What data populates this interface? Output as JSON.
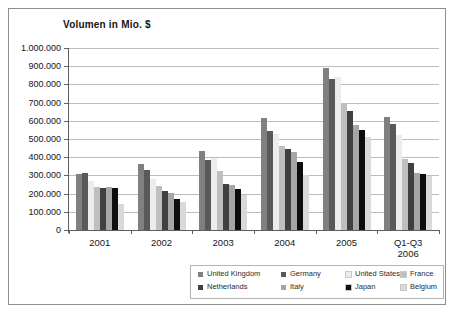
{
  "chart_data": {
    "type": "bar",
    "title": "Volumen in Mio. $",
    "categories": [
      "2001",
      "2002",
      "2003",
      "2004",
      "2005",
      "Q1-Q3 2006"
    ],
    "category_label_lines": [
      [
        "2001"
      ],
      [
        "2002"
      ],
      [
        "2003"
      ],
      [
        "2004"
      ],
      [
        "2005"
      ],
      [
        "Q1-Q3",
        "2006"
      ]
    ],
    "series": [
      {
        "name": "United Kingdom",
        "color": "#808080",
        "values": [
          310000,
          360000,
          435000,
          615000,
          890000,
          620000
        ]
      },
      {
        "name": "Germany",
        "color": "#595959",
        "values": [
          315000,
          330000,
          385000,
          545000,
          830000,
          580000
        ]
      },
      {
        "name": "United States",
        "color": "#ececec",
        "values": [
          270000,
          280000,
          395000,
          530000,
          840000,
          520000
        ]
      },
      {
        "name": "France",
        "color": "#bfbfbf",
        "values": [
          235000,
          240000,
          325000,
          460000,
          700000,
          390000
        ]
      },
      {
        "name": "Netherlands",
        "color": "#404040",
        "values": [
          230000,
          215000,
          255000,
          445000,
          655000,
          370000
        ]
      },
      {
        "name": "Italy",
        "color": "#a6a6a6",
        "values": [
          235000,
          205000,
          245000,
          430000,
          575000,
          315000
        ]
      },
      {
        "name": "Japan",
        "color": "#0d0d0d",
        "values": [
          230000,
          170000,
          225000,
          375000,
          550000,
          305000
        ]
      },
      {
        "name": "Belgium",
        "color": "#d9d9d9",
        "values": [
          145000,
          155000,
          195000,
          300000,
          510000,
          295000
        ]
      }
    ],
    "ylim": [
      0,
      1000000
    ],
    "ytick_step": 100000,
    "ytick_labels": [
      "0",
      "100.000",
      "200.000",
      "300.000",
      "400.000",
      "500.000",
      "600.000",
      "700.000",
      "800.000",
      "900.000",
      "1.000.000"
    ],
    "grid": true,
    "legend_position": "bottom",
    "axis_color": "#5f5f5f",
    "gridline_color": "#bcbcbc"
  }
}
